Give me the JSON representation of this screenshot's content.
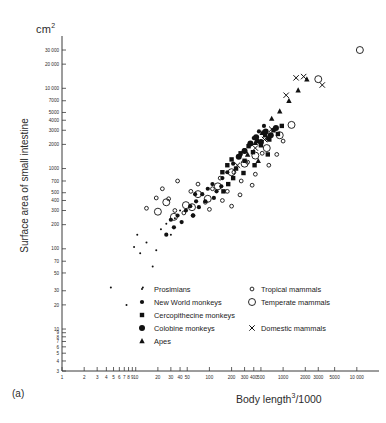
{
  "figure": {
    "panel_label": "(a)",
    "unit_label": "cm",
    "unit_exponent": "2",
    "ylabel": "Surface area of small intestine",
    "xlabel_main": "Body length",
    "xlabel_exponent": "3",
    "xlabel_suffix": "/1000"
  },
  "chart_data": {
    "type": "scatter",
    "title": "",
    "xlabel": "Body length³/1000",
    "ylabel": "Surface area of small intestine (cm²)",
    "xscale": "log",
    "yscale": "log",
    "xlim": [
      1,
      20000
    ],
    "ylim": [
      3,
      40000
    ],
    "grid": false,
    "legend_position": "inside-bottom",
    "xticks": [
      1,
      2,
      3,
      4,
      5,
      6,
      7,
      8,
      9,
      10,
      20,
      30,
      40,
      50,
      100,
      200,
      300,
      400,
      500,
      1000,
      2000,
      3000,
      5000,
      10000
    ],
    "xtick_labels": [
      "1",
      "2",
      "3",
      "4",
      "5",
      "6",
      "7",
      "8",
      "9",
      "10",
      "20",
      "30",
      "40",
      "50",
      "100",
      "200",
      "300",
      "400",
      "500",
      "1000",
      "2000",
      "3000",
      "5000",
      "10 000"
    ],
    "yticks": [
      3,
      4,
      5,
      6,
      7,
      8,
      9,
      10,
      20,
      30,
      50,
      70,
      100,
      200,
      300,
      400,
      500,
      700,
      1000,
      2000,
      3000,
      4000,
      5000,
      7000,
      10000,
      20000,
      30000
    ],
    "ytick_labels": [
      "3",
      "4",
      "5",
      "6",
      "7",
      "8",
      "9",
      "10",
      "20",
      "30",
      "50",
      "70",
      "100",
      "200",
      "300",
      "400",
      "500",
      "700",
      "1000",
      "2000",
      "3000",
      "4000",
      "5000",
      "7000",
      "10 000",
      "20 000",
      "30 000"
    ],
    "series": [
      {
        "name": "Prosimians",
        "marker": "small-filled-circle",
        "points": [
          [
            4.6,
            33
          ],
          [
            12.5,
            33
          ],
          [
            9.5,
            105
          ],
          [
            10.5,
            150
          ],
          [
            11.5,
            88
          ],
          [
            14,
            120
          ],
          [
            19,
            96
          ],
          [
            22,
            175
          ],
          [
            26,
            205
          ],
          [
            30,
            150
          ],
          [
            34,
            240
          ],
          [
            40,
            300
          ],
          [
            17,
            60
          ],
          [
            7.5,
            20
          ]
        ]
      },
      {
        "name": "New World monkeys",
        "marker": "filled-circle",
        "points": [
          [
            26,
            150
          ],
          [
            30,
            230
          ],
          [
            33,
            185
          ],
          [
            37,
            260
          ],
          [
            42,
            215
          ],
          [
            48,
            300
          ],
          [
            55,
            340
          ],
          [
            60,
            260
          ],
          [
            66,
            390
          ],
          [
            72,
            330
          ],
          [
            80,
            480
          ],
          [
            95,
            560
          ],
          [
            110,
            640
          ],
          [
            125,
            520
          ],
          [
            150,
            760
          ],
          [
            175,
            900
          ],
          [
            210,
            1150
          ],
          [
            260,
            1450
          ],
          [
            300,
            1700
          ],
          [
            350,
            2000
          ],
          [
            400,
            2400
          ],
          [
            470,
            2900
          ],
          [
            550,
            3400
          ],
          [
            115,
            430
          ],
          [
            88,
            390
          ],
          [
            64,
            480
          ],
          [
            145,
            600
          ]
        ]
      },
      {
        "name": "Cercopithecine monkeys",
        "marker": "filled-square",
        "points": [
          [
            150,
            900
          ],
          [
            175,
            1100
          ],
          [
            200,
            1300
          ],
          [
            230,
            1000
          ],
          [
            265,
            1550
          ],
          [
            300,
            1250
          ],
          [
            340,
            1900
          ],
          [
            390,
            1600
          ],
          [
            440,
            2200
          ],
          [
            500,
            1950
          ],
          [
            570,
            2600
          ],
          [
            650,
            2300
          ],
          [
            740,
            3000
          ],
          [
            850,
            2700
          ],
          [
            960,
            3400
          ],
          [
            210,
            760
          ],
          [
            290,
            880
          ],
          [
            180,
            640
          ],
          [
            410,
            1100
          ],
          [
            620,
            1500
          ],
          [
            155,
            520
          ]
        ]
      },
      {
        "name": "Colobine monkeys",
        "marker": "large-filled-circle",
        "points": [
          [
            300,
            1650
          ],
          [
            360,
            2050
          ],
          [
            430,
            2450
          ],
          [
            500,
            2150
          ],
          [
            580,
            2900
          ],
          [
            680,
            2600
          ],
          [
            800,
            3200
          ],
          [
            250,
            1400
          ]
        ]
      },
      {
        "name": "Apes",
        "marker": "filled-triangle",
        "points": [
          [
            330,
            1500
          ],
          [
            420,
            2100
          ],
          [
            520,
            2800
          ],
          [
            700,
            4200
          ],
          [
            900,
            5200
          ],
          [
            1200,
            7000
          ],
          [
            1600,
            9500
          ],
          [
            2100,
            13000
          ],
          [
            460,
            1250
          ],
          [
            620,
            2400
          ]
        ]
      },
      {
        "name": "Tropical mammals",
        "marker": "small-open-circle",
        "points": [
          [
            14,
            320
          ],
          [
            19,
            430
          ],
          [
            23,
            560
          ],
          [
            28,
            420
          ],
          [
            34,
            300
          ],
          [
            45,
            280
          ],
          [
            56,
            520
          ],
          [
            70,
            640
          ],
          [
            88,
            380
          ],
          [
            110,
            560
          ],
          [
            140,
            760
          ],
          [
            175,
            520
          ],
          [
            215,
            900
          ],
          [
            270,
            700
          ],
          [
            330,
            1200
          ],
          [
            420,
            850
          ],
          [
            520,
            1550
          ],
          [
            640,
            1100
          ],
          [
            820,
            1500
          ],
          [
            1000,
            2200
          ],
          [
            60,
            260
          ],
          [
            100,
            310
          ],
          [
            260,
            470
          ],
          [
            150,
            400
          ],
          [
            380,
            620
          ],
          [
            200,
            340
          ],
          [
            37,
            700
          ]
        ]
      },
      {
        "name": "Temperate mammals",
        "marker": "large-open-circle",
        "points": [
          [
            20,
            290
          ],
          [
            26,
            380
          ],
          [
            33,
            250
          ],
          [
            48,
            350
          ],
          [
            70,
            480
          ],
          [
            95,
            420
          ],
          [
            130,
            600
          ],
          [
            200,
            900
          ],
          [
            300,
            1150
          ],
          [
            420,
            1450
          ],
          [
            600,
            1800
          ],
          [
            900,
            2600
          ],
          [
            1300,
            3500
          ],
          [
            3000,
            13000
          ],
          [
            11000,
            30000
          ],
          [
            58,
            330
          ]
        ]
      },
      {
        "name": "Domestic mammals",
        "marker": "x",
        "points": [
          [
            240,
            1100
          ],
          [
            420,
            1800
          ],
          [
            700,
            3100
          ],
          [
            1100,
            8200
          ],
          [
            1500,
            13500
          ],
          [
            1900,
            14000
          ],
          [
            3400,
            11000
          ],
          [
            560,
            2300
          ]
        ]
      }
    ]
  },
  "legend": {
    "left_column": [
      {
        "label": "Prosimians",
        "marker": "small-filled-circle"
      },
      {
        "label": "New World monkeys",
        "marker": "filled-circle"
      },
      {
        "label": "Cercopithecine monkeys",
        "marker": "filled-square"
      },
      {
        "label": "Colobine monkeys",
        "marker": "large-filled-circle"
      },
      {
        "label": "Apes",
        "marker": "filled-triangle"
      }
    ],
    "right_column": [
      {
        "label": "Tropical mammals",
        "marker": "small-open-circle"
      },
      {
        "label": "Temperate mammals",
        "marker": "large-open-circle"
      },
      {
        "label": "Domestic mammals",
        "marker": "x"
      }
    ]
  }
}
